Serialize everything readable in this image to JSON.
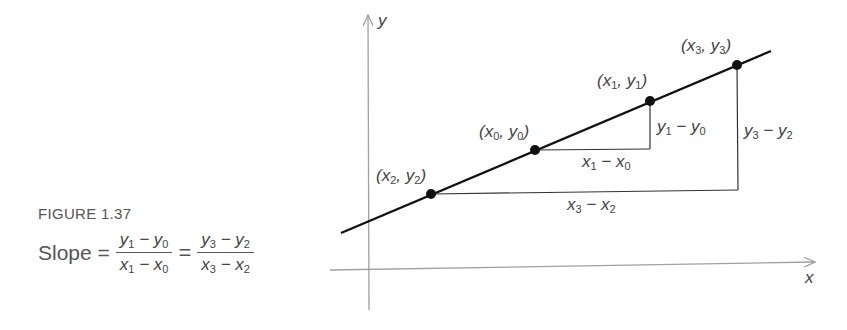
{
  "figure": {
    "caption": "FIGURE 1.37",
    "formula": {
      "label": "Slope =",
      "equals": "=",
      "frac1": {
        "numerator": {
          "a": "y",
          "a_sub": "1",
          "op": " − ",
          "b": "y",
          "b_sub": "0"
        },
        "denominator": {
          "a": "x",
          "a_sub": "1",
          "op": " − ",
          "b": "x",
          "b_sub": "0"
        }
      },
      "frac2": {
        "numerator": {
          "a": "y",
          "a_sub": "3",
          "op": " − ",
          "b": "y",
          "b_sub": "2"
        },
        "denominator": {
          "a": "x",
          "a_sub": "3",
          "op": " − ",
          "b": "x",
          "b_sub": "2"
        }
      }
    }
  },
  "axes": {
    "x_label": "x",
    "y_label": "y"
  },
  "points": [
    {
      "id": "p2",
      "label": {
        "x": "x",
        "x_sub": "2",
        "y": "y",
        "y_sub": "2"
      }
    },
    {
      "id": "p0",
      "label": {
        "x": "x",
        "x_sub": "0",
        "y": "y",
        "y_sub": "0"
      }
    },
    {
      "id": "p1",
      "label": {
        "x": "x",
        "x_sub": "1",
        "y": "y",
        "y_sub": "1"
      }
    },
    {
      "id": "p3",
      "label": {
        "x": "x",
        "x_sub": "3",
        "y": "y",
        "y_sub": "3"
      }
    }
  ],
  "differences": {
    "run_small": {
      "a": "x",
      "a_sub": "1",
      "op": " − ",
      "b": "x",
      "b_sub": "0"
    },
    "rise_small": {
      "a": "y",
      "a_sub": "1",
      "op": " − ",
      "b": "y",
      "b_sub": "0"
    },
    "run_large": {
      "a": "x",
      "a_sub": "3",
      "op": " − ",
      "b": "x",
      "b_sub": "2"
    },
    "rise_large": {
      "a": "y",
      "a_sub": "3",
      "op": " − ",
      "b": "y",
      "b_sub": "2"
    }
  },
  "colors": {
    "line": "#111111",
    "axis": "#9a9a9a",
    "text": "#4a4a4a"
  }
}
